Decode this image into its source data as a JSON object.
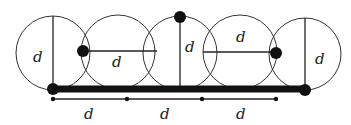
{
  "diagram": {
    "colors": {
      "stroke": "#222222",
      "fill": "#111111",
      "background": "#ffffff"
    },
    "circles": [
      {
        "cx": 53,
        "cy": 53,
        "r": 37
      },
      {
        "cx": 118,
        "cy": 52,
        "r": 37
      },
      {
        "cx": 180,
        "cy": 53,
        "r": 37
      },
      {
        "cx": 240,
        "cy": 52,
        "r": 37
      },
      {
        "cx": 305,
        "cy": 54,
        "r": 36
      }
    ],
    "labels": {
      "circle1": "d",
      "circle2": "d",
      "circle3": "d",
      "circle4": "d",
      "circle5": "d",
      "span1": "d",
      "span2": "d",
      "span3": "d"
    }
  }
}
